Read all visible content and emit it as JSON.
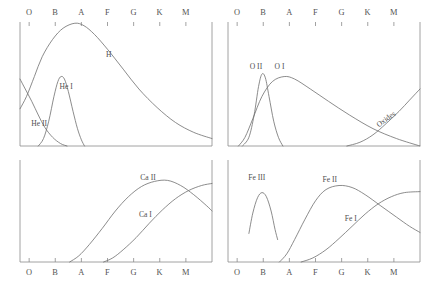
{
  "figure": {
    "axis_label_sequence": [
      "O",
      "B",
      "A",
      "F",
      "G",
      "K",
      "M"
    ],
    "colors": {
      "curve": "#6f6f6f",
      "frame": "#8a8a8a",
      "text": "#4f4f4f",
      "background": "#ffffff"
    }
  },
  "chart_data": {
    "type": "line",
    "title": "",
    "xlabel": "",
    "ylabel": "",
    "x_tick_labels": [
      "O",
      "B",
      "A",
      "F",
      "G",
      "K",
      "M"
    ],
    "x_tick_positions": [
      0,
      1,
      2,
      3,
      4,
      5,
      6
    ],
    "xlim": [
      -0.35,
      7.0
    ],
    "ylim": [
      0,
      1
    ],
    "grid": false,
    "legend_position": "inline-annotations",
    "panels": [
      {
        "id": "top-left",
        "position": "top-left",
        "series": [
          {
            "name": "H",
            "label": "H",
            "label_x": 3.05,
            "label_y": 0.72,
            "points": [
              [
                -0.35,
                0.3
              ],
              [
                -0.1,
                0.4
              ],
              [
                0.2,
                0.56
              ],
              [
                0.5,
                0.72
              ],
              [
                0.9,
                0.86
              ],
              [
                1.3,
                0.95
              ],
              [
                1.75,
                0.99
              ],
              [
                2.1,
                0.97
              ],
              [
                2.5,
                0.9
              ],
              [
                3.0,
                0.78
              ],
              [
                3.6,
                0.62
              ],
              [
                4.2,
                0.46
              ],
              [
                4.9,
                0.31
              ],
              [
                5.6,
                0.19
              ],
              [
                6.3,
                0.11
              ],
              [
                7.0,
                0.06
              ]
            ]
          },
          {
            "name": "He I",
            "label": "He I",
            "label_x": 1.42,
            "label_y": 0.46,
            "points": [
              [
                0.35,
                0.0
              ],
              [
                0.55,
                0.06
              ],
              [
                0.75,
                0.2
              ],
              [
                0.95,
                0.4
              ],
              [
                1.1,
                0.52
              ],
              [
                1.22,
                0.56
              ],
              [
                1.35,
                0.54
              ],
              [
                1.5,
                0.44
              ],
              [
                1.68,
                0.28
              ],
              [
                1.85,
                0.14
              ],
              [
                2.0,
                0.05
              ],
              [
                2.12,
                0.0
              ]
            ]
          },
          {
            "name": "He II",
            "label": "He II",
            "label_x": 0.38,
            "label_y": 0.16,
            "points": [
              [
                -0.35,
                0.54
              ],
              [
                -0.15,
                0.46
              ],
              [
                0.1,
                0.36
              ],
              [
                0.35,
                0.25
              ],
              [
                0.6,
                0.15
              ],
              [
                0.9,
                0.07
              ],
              [
                1.2,
                0.02
              ],
              [
                1.45,
                0.0
              ]
            ]
          }
        ]
      },
      {
        "id": "top-right",
        "position": "top-right",
        "series": [
          {
            "name": "O II",
            "label": "O II",
            "label_x": 0.72,
            "label_y": 0.62,
            "points": [
              [
                0.2,
                0.0
              ],
              [
                0.45,
                0.07
              ],
              [
                0.65,
                0.25
              ],
              [
                0.82,
                0.48
              ],
              [
                0.95,
                0.58
              ],
              [
                1.08,
                0.55
              ],
              [
                1.22,
                0.4
              ],
              [
                1.4,
                0.2
              ],
              [
                1.58,
                0.07
              ],
              [
                1.75,
                0.0
              ]
            ]
          },
          {
            "name": "O I",
            "label": "O I",
            "label_x": 1.62,
            "label_y": 0.62,
            "points": [
              [
                0.05,
                0.0
              ],
              [
                0.3,
                0.07
              ],
              [
                0.6,
                0.22
              ],
              [
                0.95,
                0.4
              ],
              [
                1.35,
                0.52
              ],
              [
                1.8,
                0.56
              ],
              [
                2.2,
                0.54
              ],
              [
                2.8,
                0.46
              ],
              [
                3.5,
                0.36
              ],
              [
                4.3,
                0.25
              ],
              [
                5.2,
                0.14
              ],
              [
                6.1,
                0.06
              ],
              [
                7.0,
                0.0
              ]
            ]
          },
          {
            "name": "Oxides",
            "label": "Oxides",
            "label_x": 5.75,
            "label_y": 0.2,
            "rotated": true,
            "points": [
              [
                4.2,
                0.0
              ],
              [
                4.7,
                0.03
              ],
              [
                5.2,
                0.09
              ],
              [
                5.7,
                0.18
              ],
              [
                6.2,
                0.28
              ],
              [
                6.6,
                0.37
              ],
              [
                7.0,
                0.46
              ]
            ]
          }
        ]
      },
      {
        "id": "bottom-left",
        "position": "bottom-left",
        "series": [
          {
            "name": "Ca II",
            "label": "Ca II",
            "label_x": 4.55,
            "label_y": 0.8,
            "points": [
              [
                1.55,
                0.0
              ],
              [
                1.9,
                0.06
              ],
              [
                2.3,
                0.17
              ],
              [
                2.8,
                0.33
              ],
              [
                3.3,
                0.5
              ],
              [
                3.8,
                0.64
              ],
              [
                4.3,
                0.74
              ],
              [
                4.8,
                0.79
              ],
              [
                5.3,
                0.8
              ],
              [
                5.8,
                0.75
              ],
              [
                6.3,
                0.66
              ],
              [
                6.8,
                0.55
              ],
              [
                7.0,
                0.5
              ]
            ]
          },
          {
            "name": "Ca I",
            "label": "Ca I",
            "label_x": 4.45,
            "label_y": 0.44,
            "points": [
              [
                2.85,
                0.0
              ],
              [
                3.2,
                0.04
              ],
              [
                3.6,
                0.12
              ],
              [
                4.1,
                0.24
              ],
              [
                4.6,
                0.38
              ],
              [
                5.1,
                0.51
              ],
              [
                5.6,
                0.62
              ],
              [
                6.1,
                0.7
              ],
              [
                6.6,
                0.75
              ],
              [
                7.0,
                0.77
              ]
            ]
          }
        ]
      },
      {
        "id": "bottom-right",
        "position": "bottom-right",
        "series": [
          {
            "name": "Fe III",
            "label": "Fe III",
            "label_x": 0.75,
            "label_y": 0.8,
            "points": [
              [
                0.45,
                0.28
              ],
              [
                0.6,
                0.48
              ],
              [
                0.78,
                0.63
              ],
              [
                0.95,
                0.68
              ],
              [
                1.12,
                0.64
              ],
              [
                1.3,
                0.5
              ],
              [
                1.45,
                0.32
              ],
              [
                1.55,
                0.22
              ]
            ]
          },
          {
            "name": "Fe II",
            "label": "Fe II",
            "label_x": 3.55,
            "label_y": 0.78,
            "points": [
              [
                1.62,
                0.0
              ],
              [
                1.9,
                0.08
              ],
              [
                2.2,
                0.22
              ],
              [
                2.6,
                0.42
              ],
              [
                3.0,
                0.6
              ],
              [
                3.4,
                0.71
              ],
              [
                3.9,
                0.75
              ],
              [
                4.4,
                0.73
              ],
              [
                4.9,
                0.66
              ],
              [
                5.5,
                0.55
              ],
              [
                6.1,
                0.44
              ],
              [
                6.6,
                0.35
              ],
              [
                7.0,
                0.29
              ]
            ]
          },
          {
            "name": "Fe I",
            "label": "Fe I",
            "label_x": 4.35,
            "label_y": 0.4,
            "points": [
              [
                2.45,
                0.0
              ],
              [
                2.9,
                0.04
              ],
              [
                3.4,
                0.12
              ],
              [
                3.9,
                0.23
              ],
              [
                4.4,
                0.35
              ],
              [
                4.9,
                0.47
              ],
              [
                5.4,
                0.57
              ],
              [
                5.9,
                0.64
              ],
              [
                6.4,
                0.68
              ],
              [
                7.0,
                0.69
              ]
            ]
          }
        ]
      }
    ]
  }
}
